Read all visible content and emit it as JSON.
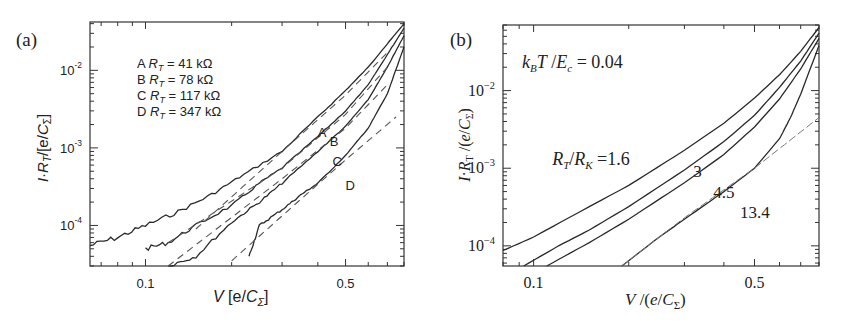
{
  "chart_data": [
    {
      "panel_label": "(a)",
      "type": "line",
      "xscale": "log",
      "yscale": "log",
      "xlabel": "V [e/C_Σ]",
      "ylabel": "I·R_T/[e/C_Σ]",
      "xlim": [
        0.064,
        0.8
      ],
      "ylim": [
        3e-05,
        0.042
      ],
      "x_ticks": [
        {
          "value": 0.1,
          "label": "0.1"
        },
        {
          "value": 0.5,
          "label": "0.5"
        }
      ],
      "y_ticks": [
        {
          "value": 0.0001,
          "label": "10",
          "exp": "-4"
        },
        {
          "value": 0.001,
          "label": "10",
          "exp": "-3"
        },
        {
          "value": 0.01,
          "label": "10",
          "exp": "-2"
        }
      ],
      "legend": [
        {
          "key": "A",
          "text": "R_T = 41 kΩ"
        },
        {
          "key": "B",
          "text": "R_T = 78 kΩ"
        },
        {
          "key": "C",
          "text": "R_T = 117 kΩ"
        },
        {
          "key": "D",
          "text": "R_T = 347 kΩ"
        }
      ],
      "series": [
        {
          "name": "A",
          "style": "solid-noisy",
          "x": [
            0.064,
            0.08,
            0.1,
            0.13,
            0.17,
            0.22,
            0.3,
            0.4,
            0.5,
            0.6,
            0.7,
            0.8
          ],
          "y": [
            5.5e-05,
            7e-05,
            0.0001,
            0.00015,
            0.00025,
            0.00045,
            0.0009,
            0.0025,
            0.0055,
            0.011,
            0.022,
            0.04
          ]
        },
        {
          "name": "B",
          "style": "solid-noisy",
          "x": [
            0.1,
            0.12,
            0.15,
            0.2,
            0.25,
            0.3,
            0.4,
            0.5,
            0.6,
            0.7,
            0.8
          ],
          "y": [
            5e-05,
            6e-05,
            0.0001,
            0.00018,
            0.00035,
            0.00055,
            0.0014,
            0.003,
            0.0065,
            0.016,
            0.035
          ]
        },
        {
          "name": "C",
          "style": "solid-noisy",
          "x": [
            0.12,
            0.15,
            0.2,
            0.25,
            0.3,
            0.4,
            0.5,
            0.6,
            0.7,
            0.8
          ],
          "y": [
            3e-05,
            4e-05,
            0.00011,
            0.0002,
            0.00035,
            0.0009,
            0.0019,
            0.0042,
            0.011,
            0.028
          ]
        },
        {
          "name": "D",
          "style": "solid-noisy",
          "x": [
            0.23,
            0.25,
            0.3,
            0.35,
            0.4,
            0.5,
            0.6,
            0.7,
            0.8
          ],
          "y": [
            4e-05,
            0.0001,
            0.00016,
            0.00025,
            0.00035,
            0.0008,
            0.0018,
            0.005,
            0.02
          ]
        },
        {
          "name": "A-fit",
          "style": "dashed",
          "x": [
            0.15,
            0.3,
            0.5,
            0.7
          ],
          "y": [
            9e-05,
            0.0009,
            0.0048,
            0.017
          ]
        },
        {
          "name": "B-fit",
          "style": "dashed",
          "x": [
            0.12,
            0.3,
            0.5,
            0.7
          ],
          "y": [
            6e-05,
            0.00055,
            0.0027,
            0.011
          ]
        },
        {
          "name": "C-fit",
          "style": "dashed",
          "x": [
            0.12,
            0.3,
            0.5,
            0.7
          ],
          "y": [
            3e-05,
            0.0004,
            0.0018,
            0.0065
          ]
        },
        {
          "name": "D-fit",
          "style": "dashed",
          "x": [
            0.2,
            0.35,
            0.5,
            0.75
          ],
          "y": [
            3.5e-05,
            0.00022,
            0.0007,
            0.0025
          ]
        }
      ],
      "annotations": [
        {
          "text": "A",
          "x": 0.4,
          "y": 0.0014
        },
        {
          "text": "B",
          "x": 0.44,
          "y": 0.00105
        },
        {
          "text": "C",
          "x": 0.45,
          "y": 0.00058
        },
        {
          "text": "D",
          "x": 0.5,
          "y": 0.00029
        }
      ],
      "grid": false
    },
    {
      "panel_label": "(b)",
      "type": "line",
      "xscale": "log",
      "yscale": "log",
      "xlabel": "V/(e/C_Σ)",
      "ylabel": "I·R_T/(e/C_Σ)",
      "xlim": [
        0.08,
        0.8
      ],
      "ylim": [
        5.5e-05,
        0.07
      ],
      "x_ticks": [
        {
          "value": 0.1,
          "label": "0.1"
        },
        {
          "value": 0.5,
          "label": "0.5"
        }
      ],
      "y_ticks": [
        {
          "value": 0.0001,
          "label": "10",
          "exp": "−4"
        },
        {
          "value": 0.001,
          "label": "10",
          "exp": "−3"
        },
        {
          "value": 0.01,
          "label": "10",
          "exp": "−2"
        }
      ],
      "parameter_text": "k_B T/E_c = 0.04",
      "series": [
        {
          "name": "R_T/R_K = 1.6",
          "x": [
            0.08,
            0.1,
            0.15,
            0.2,
            0.3,
            0.4,
            0.5,
            0.6,
            0.7,
            0.8
          ],
          "y": [
            8.7e-05,
            0.00013,
            0.00032,
            0.0006,
            0.0017,
            0.0038,
            0.008,
            0.016,
            0.032,
            0.065
          ]
        },
        {
          "name": "3",
          "x": [
            0.093,
            0.12,
            0.15,
            0.2,
            0.3,
            0.4,
            0.5,
            0.6,
            0.7,
            0.8
          ],
          "y": [
            5.5e-05,
            0.0001,
            0.00016,
            0.00032,
            0.00095,
            0.0022,
            0.0048,
            0.011,
            0.024,
            0.055
          ]
        },
        {
          "name": "4.5",
          "x": [
            0.11,
            0.15,
            0.2,
            0.3,
            0.4,
            0.5,
            0.6,
            0.7,
            0.8
          ],
          "y": [
            5.5e-05,
            0.00011,
            0.00022,
            0.00065,
            0.0015,
            0.0034,
            0.0078,
            0.019,
            0.047
          ]
        },
        {
          "name": "13.4",
          "x": [
            0.19,
            0.25,
            0.3,
            0.4,
            0.5,
            0.6,
            0.65,
            0.7,
            0.8
          ],
          "y": [
            5.5e-05,
            0.00013,
            0.00022,
            0.0005,
            0.001,
            0.0024,
            0.0045,
            0.009,
            0.038
          ]
        },
        {
          "name": "asymptote",
          "style": "dashed",
          "x": [
            0.19,
            0.3,
            0.5,
            0.8
          ],
          "y": [
            5.5e-05,
            0.00023,
            0.001,
            0.0045
          ]
        }
      ],
      "annotations": [
        {
          "text": "R_T/R_K = 1.6",
          "x": 0.205,
          "y": 0.0011
        },
        {
          "text": "3",
          "x": 0.32,
          "y": 0.00078
        },
        {
          "text": "4.5",
          "x": 0.37,
          "y": 0.00041
        },
        {
          "text": "13.4",
          "x": 0.45,
          "y": 0.00023
        }
      ],
      "grid": false
    }
  ],
  "panels": {
    "a": {
      "label": "(a)",
      "xlabel_main": "V",
      "xlabel_rest": " [e/C",
      "xlabel_sub": "Σ",
      "xlabel_end": "]",
      "legend": [
        {
          "k": "A",
          "r": "R",
          "sub": "T",
          "v": "= 41 kΩ"
        },
        {
          "k": "B",
          "r": "R",
          "sub": "T",
          "v": "= 78 kΩ"
        },
        {
          "k": "C",
          "r": "R",
          "sub": "T",
          "v": "= 117 kΩ"
        },
        {
          "k": "D",
          "r": "R",
          "sub": "T",
          "v": "= 347 kΩ"
        }
      ],
      "ylabel": "I·R_T/[e/C_Σ]"
    },
    "b": {
      "label": "(b)",
      "param_k": "k",
      "param_ksub": "B",
      "param_mid": "T /E",
      "param_esub": "c",
      "param_val": " = 0.04",
      "rr_label": "R_T/R_K = 1.6",
      "ylabel": "I·R_T/(e/C_Σ)",
      "xlabel": "V/(e/C_Σ)"
    }
  }
}
